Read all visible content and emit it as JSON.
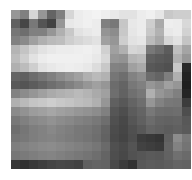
{
  "canvas": {
    "width": 192,
    "height": 180,
    "background_color": "#ffffff"
  },
  "image": {
    "kind": "pixelated-grayscale-mosaic",
    "description": "Heavily downsampled grayscale photograph rendered as blocky mosaic cells",
    "x": 11,
    "y": 10,
    "width": 180,
    "height": 159,
    "columns": 20,
    "rows": 18,
    "cell_width": 9,
    "cell_height": 8.8,
    "color_mode": "grayscale",
    "min_gray": 26,
    "max_gray": 243,
    "grayscale_matrix": [
      [
        150,
        128,
        214,
        150,
        100,
        128,
        214,
        236,
        240,
        243,
        238,
        232,
        226,
        226,
        236,
        240,
        230,
        200,
        206,
        206
      ],
      [
        96,
        70,
        120,
        84,
        66,
        150,
        232,
        236,
        240,
        236,
        128,
        120,
        198,
        232,
        236,
        206,
        170,
        238,
        236,
        216
      ],
      [
        118,
        110,
        128,
        128,
        150,
        176,
        200,
        226,
        232,
        236,
        148,
        140,
        200,
        230,
        236,
        200,
        178,
        232,
        236,
        210
      ],
      [
        128,
        138,
        160,
        176,
        186,
        190,
        206,
        214,
        220,
        226,
        160,
        150,
        206,
        226,
        230,
        186,
        168,
        214,
        226,
        196
      ],
      [
        180,
        196,
        214,
        226,
        232,
        236,
        236,
        238,
        240,
        236,
        208,
        160,
        176,
        214,
        210,
        120,
        108,
        92,
        190,
        164
      ],
      [
        188,
        206,
        226,
        236,
        240,
        240,
        240,
        240,
        238,
        232,
        216,
        150,
        146,
        180,
        186,
        96,
        90,
        86,
        176,
        150
      ],
      [
        176,
        188,
        206,
        226,
        232,
        236,
        238,
        236,
        232,
        220,
        200,
        130,
        128,
        160,
        170,
        88,
        84,
        80,
        200,
        40
      ],
      [
        100,
        96,
        108,
        118,
        128,
        140,
        150,
        160,
        176,
        186,
        178,
        118,
        110,
        130,
        140,
        108,
        100,
        126,
        176,
        34
      ],
      [
        88,
        84,
        92,
        100,
        110,
        118,
        128,
        138,
        150,
        160,
        150,
        108,
        100,
        120,
        128,
        150,
        140,
        160,
        150,
        30
      ],
      [
        130,
        140,
        150,
        160,
        170,
        176,
        180,
        186,
        180,
        170,
        160,
        110,
        98,
        112,
        120,
        176,
        150,
        140,
        128,
        36
      ],
      [
        176,
        186,
        196,
        200,
        206,
        200,
        196,
        190,
        186,
        176,
        150,
        96,
        88,
        100,
        110,
        150,
        130,
        120,
        118,
        60
      ],
      [
        138,
        146,
        156,
        160,
        166,
        160,
        156,
        150,
        146,
        140,
        128,
        86,
        78,
        92,
        100,
        120,
        110,
        108,
        110,
        78
      ],
      [
        120,
        128,
        136,
        140,
        146,
        140,
        136,
        130,
        126,
        120,
        110,
        80,
        72,
        86,
        96,
        108,
        100,
        98,
        100,
        88
      ],
      [
        110,
        118,
        126,
        130,
        136,
        130,
        126,
        120,
        118,
        112,
        100,
        76,
        70,
        80,
        88,
        100,
        96,
        92,
        96,
        90
      ],
      [
        116,
        120,
        126,
        130,
        132,
        128,
        124,
        120,
        116,
        110,
        98,
        74,
        68,
        78,
        60,
        56,
        52,
        96,
        140,
        120
      ],
      [
        126,
        130,
        134,
        138,
        140,
        136,
        132,
        128,
        124,
        118,
        106,
        80,
        74,
        84,
        66,
        62,
        58,
        100,
        130,
        116
      ],
      [
        118,
        122,
        126,
        130,
        132,
        128,
        124,
        120,
        116,
        110,
        100,
        78,
        72,
        82,
        86,
        90,
        88,
        98,
        112,
        106
      ],
      [
        54,
        48,
        56,
        62,
        68,
        72,
        70,
        66,
        96,
        100,
        98,
        72,
        60,
        50,
        88,
        92,
        90,
        94,
        100,
        98
      ]
    ]
  }
}
